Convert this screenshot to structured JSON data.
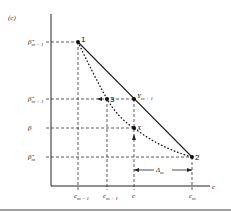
{
  "panel_label": "(c)",
  "axes": {
    "x_label": "c",
    "y_label": ""
  },
  "y_ticks": [
    {
      "base": "β̂",
      "sub": "m − 1",
      "y": 42
    },
    {
      "base": "β̂",
      "sub": "m + 1",
      "y": 99
    },
    {
      "base": "β",
      "sub": "",
      "y": 128
    },
    {
      "base": "β̂",
      "sub": "m",
      "y": 157
    }
  ],
  "x_ticks": [
    {
      "base": "c",
      "sub": "m − 1",
      "x": 78
    },
    {
      "base": "c",
      "sub": "m + 1",
      "x": 107
    },
    {
      "base": "c",
      "sub": "",
      "x": 134
    },
    {
      "base": "c",
      "sub": "m",
      "x": 192
    }
  ],
  "points": [
    {
      "label": "1",
      "x": 78,
      "y": 42
    },
    {
      "label": "3",
      "x": 107,
      "y": 99
    },
    {
      "label": "Y",
      "sub": "m + 1",
      "x": 134,
      "y": 99
    },
    {
      "label": "X",
      "x": 134,
      "y": 128
    },
    {
      "label": "2",
      "x": 192,
      "y": 157
    }
  ],
  "delta_label": {
    "base": "Δ",
    "sub": "m"
  },
  "colors": {
    "line": "#222222",
    "dashed": "#333333",
    "background": "#ffffff"
  }
}
